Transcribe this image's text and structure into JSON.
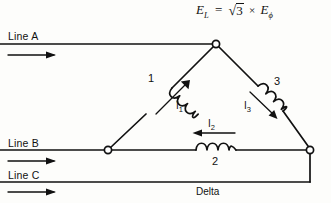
{
  "figure": {
    "caption": "Delta",
    "formula": {
      "lhs": "E",
      "lhs_sub": "L",
      "eq": "=",
      "radical": "3",
      "times": "×",
      "rhs": "E",
      "rhs_sub": "ϕ",
      "plain": "E_L = √3 × E_ϕ"
    },
    "lines": [
      {
        "label": "Line A",
        "arrow": "right-arrow-icon"
      },
      {
        "label": "Line B",
        "arrow": "right-arrow-icon"
      },
      {
        "label": "Line C",
        "arrow": "right-arrow-icon"
      }
    ],
    "windings": [
      {
        "label": "1",
        "current": "I",
        "current_sub": "1",
        "current_plain": "I1",
        "icon": "coil-icon"
      },
      {
        "label": "2",
        "current": "I",
        "current_sub": "2",
        "current_plain": "I2",
        "icon": "coil-icon"
      },
      {
        "label": "3",
        "current": "I",
        "current_sub": "3",
        "current_plain": "I3",
        "icon": "coil-icon"
      }
    ],
    "nodes": [
      {
        "name": "node-a-top"
      },
      {
        "name": "node-b-left"
      },
      {
        "name": "node-c-right"
      }
    ],
    "colors": {
      "stroke": "#111111",
      "background": "#fdfdfb",
      "node_fill": "#ffffff"
    }
  }
}
